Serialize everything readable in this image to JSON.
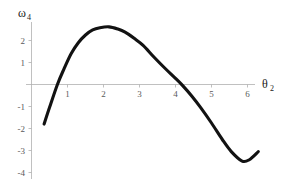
{
  "chart_data": {
    "type": "line",
    "title": "",
    "xlabel": "θ",
    "xlabel_sub": "2",
    "ylabel": "ω",
    "ylabel_sub": "4",
    "xlim": [
      0.0,
      6.55
    ],
    "ylim": [
      -4.0,
      2.95
    ],
    "grid": false,
    "legend": false,
    "xticks": [
      1,
      2,
      3,
      4,
      5,
      6
    ],
    "xtick_labels": [
      "1",
      "2",
      "3",
      "4",
      "5",
      "6"
    ],
    "yticks": [
      2,
      1,
      -1,
      -2,
      -3,
      -4
    ],
    "ytick_labels": [
      "2",
      "1",
      "-1",
      "-2",
      "-3",
      "-4"
    ],
    "series": [
      {
        "name": "ω₄(θ₂)",
        "color": "#121212",
        "x": [
          0.35,
          0.5,
          0.72,
          0.9,
          1.1,
          1.3,
          1.5,
          1.7,
          1.9,
          2.15,
          2.4,
          2.6,
          2.85,
          3.1,
          3.4,
          3.7,
          4.0,
          4.2,
          4.45,
          4.7,
          5.0,
          5.3,
          5.55,
          5.85,
          6.05,
          6.3
        ],
        "y": [
          -1.8,
          -1.05,
          0.0,
          0.7,
          1.4,
          1.9,
          2.25,
          2.48,
          2.58,
          2.62,
          2.52,
          2.38,
          2.1,
          1.78,
          1.25,
          0.75,
          0.28,
          -0.05,
          -0.52,
          -1.05,
          -1.75,
          -2.5,
          -3.05,
          -3.48,
          -3.42,
          -3.05
        ]
      }
    ],
    "zero_crossings": [
      0.72,
      4.45
    ],
    "maximum": {
      "x": 2.15,
      "y": 2.62
    },
    "minimum": {
      "x": 5.85,
      "y": -3.48
    }
  },
  "axes": {
    "x_axis_name": "horizontal-axis",
    "y_axis_name": "vertical-axis",
    "x_title": "θ",
    "x_title_sub": "2",
    "y_title": "ω",
    "y_title_sub": "4"
  }
}
